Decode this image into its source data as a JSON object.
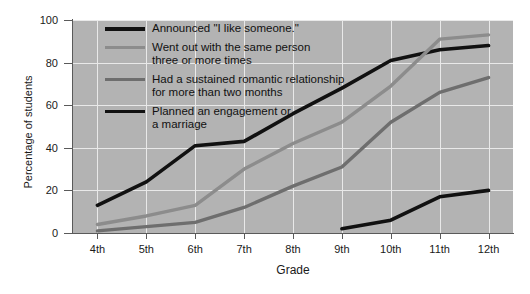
{
  "chart_data": {
    "type": "line",
    "title": "",
    "xlabel": "Grade",
    "ylabel": "Percentage of students",
    "categories": [
      "4th",
      "5th",
      "6th",
      "7th",
      "8th",
      "9th",
      "10th",
      "11th",
      "12th"
    ],
    "ylim": [
      0,
      100
    ],
    "ytick_labels": [
      "0",
      "20",
      "40",
      "60",
      "80",
      "100"
    ],
    "ytick_values": [
      0,
      20,
      40,
      60,
      80,
      100
    ],
    "grid": true,
    "legend_position": "upper-left-inside",
    "series": [
      {
        "name": "Announced \"I like someone.\"",
        "color": "#111111",
        "values": [
          13,
          24,
          41,
          43,
          56,
          68,
          81,
          86,
          88
        ]
      },
      {
        "name": "Went out with the same person\nthree or more times",
        "color": "#8c8c8c",
        "values": [
          4,
          8,
          13,
          30,
          42,
          52,
          69,
          91,
          93
        ]
      },
      {
        "name": "Had a sustained romantic relationship\nfor more than two months",
        "color": "#6e6e6e",
        "values": [
          1,
          3,
          5,
          12,
          22,
          31,
          52,
          66,
          73
        ]
      },
      {
        "name": "Planned an engagement or\na marriage",
        "color": "#111111",
        "values": [
          null,
          null,
          null,
          null,
          null,
          2,
          6,
          17,
          20
        ]
      }
    ]
  },
  "style": {
    "plot_background": "#b3b3b3",
    "grid_color": "#e9e9e9",
    "axis_color": "#5a5a5a",
    "page_background": "#ffffff"
  },
  "legend": {
    "items": [
      {
        "label": "Announced \"I like someone.\"",
        "color": "#111111",
        "weight": 3.6
      },
      {
        "label": "Went out with the same person\nthree or more times",
        "color": "#8c8c8c",
        "weight": 3.4
      },
      {
        "label": "Had a sustained romantic relationship\nfor more than two months",
        "color": "#6e6e6e",
        "weight": 3.4
      },
      {
        "label": "Planned an engagement or\na marriage",
        "color": "#111111",
        "weight": 3.6
      }
    ]
  }
}
